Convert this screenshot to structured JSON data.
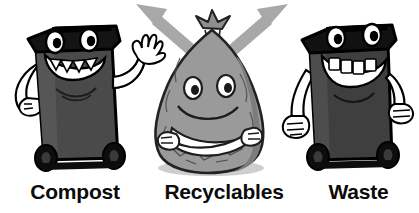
{
  "illustration": {
    "title": "Waste sorting cartoon characters",
    "background_color": "#ffffff",
    "characters": [
      {
        "name": "compost-bin",
        "label": "Compost",
        "body_color": "#4a4a4a",
        "lid_color": "#141414",
        "outline_color": "#000000",
        "limb_color": "#ffffff",
        "teeth_shape": "pointed-triangles",
        "pose": "left hand on hip, right hand waving",
        "wheels": 2
      },
      {
        "name": "recyclables-bag",
        "label": "Recyclables",
        "body_color": "#9a9a9a",
        "shade_color": "#7c7c7c",
        "outline_color": "#222222",
        "limb_color": "#ffffff",
        "teeth_shape": "none",
        "pose": "arms crossed over belly",
        "top": "tied knot"
      },
      {
        "name": "waste-bin",
        "label": "Waste",
        "body_color": "#3f3f3f",
        "lid_color": "#111111",
        "outline_color": "#000000",
        "limb_color": "#ffffff",
        "teeth_shape": "square-blocks",
        "pose": "both arms hanging at sides",
        "wheels": 2
      }
    ],
    "arrows": [
      {
        "name": "arrow-up-left",
        "color": "#a8a8a8",
        "direction": "up-left"
      },
      {
        "name": "arrow-up-right",
        "color": "#a8a8a8",
        "direction": "up-right"
      }
    ]
  },
  "labels": {
    "compost": "Compost",
    "recyclables": "Recyclables",
    "waste": "Waste"
  },
  "colors": {
    "bin_dark": "#4a4a4a",
    "bin_darker": "#3f3f3f",
    "lid_black": "#141414",
    "bag_gray": "#9a9a9a",
    "bag_shade": "#7c7c7c",
    "arrow_gray": "#a8a8a8",
    "outline": "#000000",
    "limb_white": "#ffffff",
    "text_black": "#0b0b0b",
    "background": "#ffffff"
  }
}
